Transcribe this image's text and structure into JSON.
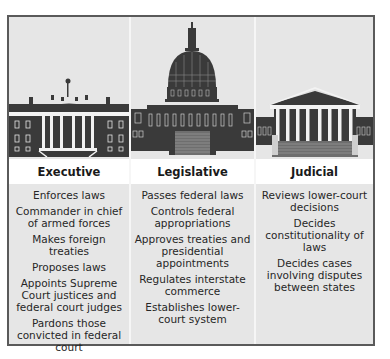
{
  "branches": [
    {
      "name": "Executive",
      "building": "white-house",
      "powers": [
        "Enforces laws",
        "Commander in chief of armed forces",
        "Makes foreign treaties",
        "Proposes laws",
        "Appoints Supreme Court justices and federal court judges",
        "Pardons those convicted in federal court"
      ]
    },
    {
      "name": "Legislative",
      "building": "capitol",
      "powers": [
        "Passes federal laws",
        "Controls federal appropriations",
        "Approves treaties and presidential appointments",
        "Regulates interstate commerce",
        "Establishes lower-court system"
      ]
    },
    {
      "name": "Judicial",
      "building": "supreme-court",
      "powers": [
        "Reviews lower-court decisions",
        "Decides constitutionality of laws",
        "Decides cases involving disputes between states"
      ]
    }
  ],
  "colors": {
    "panel": "#e6e6e6",
    "header": "#ffffff",
    "border": "#5a5a5a",
    "building": "#3a3a3a"
  }
}
